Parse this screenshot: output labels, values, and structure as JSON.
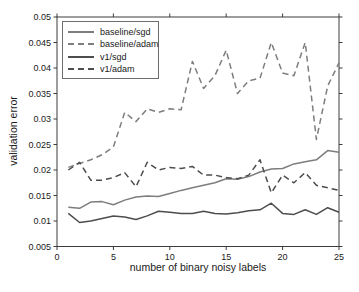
{
  "figure": {
    "background": "#ffffff",
    "frame_color": "#3c3c3c",
    "text_color": "#1a1a1a",
    "baseline_color": "#7d7d7d",
    "v1_color": "#4d4d4d"
  },
  "chart_data": {
    "type": "line",
    "title": "",
    "xlabel": "number of binary noisy labels",
    "ylabel": "validation error",
    "xlim": [
      0,
      25
    ],
    "ylim": [
      0.005,
      0.05
    ],
    "x_ticks": [
      0,
      5,
      10,
      15,
      20,
      25
    ],
    "x_tick_labels": [
      "0",
      "5",
      "10",
      "15",
      "20",
      "25"
    ],
    "y_ticks": [
      0.005,
      0.01,
      0.015,
      0.02,
      0.025,
      0.03,
      0.035,
      0.04,
      0.045,
      0.05
    ],
    "y_tick_labels": [
      "0.005",
      "0.01",
      "0.015",
      "0.02",
      "0.025",
      "0.03",
      "0.035",
      "0.04",
      "0.045",
      "0.05"
    ],
    "grid": "off",
    "legend_position": "top-left",
    "x": [
      1,
      2,
      3,
      4,
      5,
      6,
      7,
      8,
      9,
      10,
      11,
      12,
      13,
      14,
      15,
      16,
      17,
      18,
      19,
      20,
      21,
      22,
      23,
      24,
      25
    ],
    "series": [
      {
        "name": "baseline/sgd",
        "style": "solid",
        "color": "#7d7d7d",
        "values": [
          0.0127,
          0.0125,
          0.0137,
          0.0138,
          0.0132,
          0.0141,
          0.0147,
          0.0149,
          0.0148,
          0.0154,
          0.016,
          0.0165,
          0.017,
          0.0175,
          0.0183,
          0.0182,
          0.0187,
          0.0196,
          0.0202,
          0.0203,
          0.0212,
          0.0216,
          0.022,
          0.0238,
          0.0235
        ]
      },
      {
        "name": "baseline/adam",
        "style": "dashed",
        "color": "#7d7d7d",
        "values": [
          0.0205,
          0.0213,
          0.022,
          0.023,
          0.0245,
          0.0313,
          0.0295,
          0.032,
          0.0313,
          0.032,
          0.0318,
          0.0413,
          0.036,
          0.0385,
          0.0435,
          0.035,
          0.0375,
          0.038,
          0.045,
          0.039,
          0.0385,
          0.045,
          0.026,
          0.0365,
          0.041
        ]
      },
      {
        "name": "v1/sgd",
        "style": "solid",
        "color": "#4d4d4d",
        "values": [
          0.0115,
          0.0097,
          0.01,
          0.0105,
          0.011,
          0.0108,
          0.0103,
          0.011,
          0.0119,
          0.0117,
          0.0115,
          0.0115,
          0.0119,
          0.0115,
          0.0114,
          0.0116,
          0.012,
          0.0122,
          0.0135,
          0.0115,
          0.0113,
          0.0122,
          0.0113,
          0.0126,
          0.0117
        ]
      },
      {
        "name": "v1/adam",
        "style": "dashed",
        "color": "#4d4d4d",
        "values": [
          0.02,
          0.0215,
          0.018,
          0.018,
          0.0185,
          0.0195,
          0.0167,
          0.0215,
          0.02,
          0.0205,
          0.0203,
          0.0207,
          0.019,
          0.019,
          0.0185,
          0.0183,
          0.019,
          0.022,
          0.0155,
          0.019,
          0.0175,
          0.0195,
          0.017,
          0.0165,
          0.016
        ]
      }
    ]
  }
}
